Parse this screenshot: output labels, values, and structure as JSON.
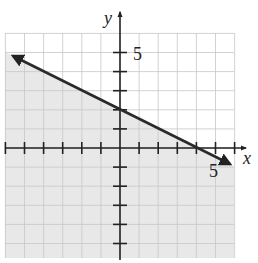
{
  "cropped_heading_fragment": "",
  "graph": {
    "type": "linear-inequality",
    "description": "Shaded half-plane below a decreasing line",
    "boundary_line": {
      "equation": "y = -x/2 + 2",
      "slope": -0.5,
      "y_intercept": 2,
      "x_intercept": 4,
      "style": "solid",
      "color": "#2a2a2a"
    },
    "inequality": "y <= -x/2 + 2",
    "shaded_region": "below",
    "shade_color": "#e6e6e6",
    "grid_color": "#c8c8c8",
    "axis_color": "#222222",
    "axes": {
      "x_label": "x",
      "y_label": "y",
      "x_tick_label": "5",
      "y_tick_label": "5",
      "x_range": [
        -6,
        6
      ],
      "y_range": [
        -5.7,
        6
      ]
    }
  },
  "chart_data": {
    "type": "line",
    "title": "",
    "xlabel": "x",
    "ylabel": "y",
    "xlim": [
      -6,
      6
    ],
    "ylim": [
      -5.7,
      6
    ],
    "grid": true,
    "series": [
      {
        "name": "y = -x/2 + 2",
        "x": [
          -6,
          0,
          4,
          6
        ],
        "y": [
          5,
          2,
          0,
          -1
        ]
      }
    ],
    "shading": "below line",
    "annotations": [
      {
        "text": "5",
        "at": "x=5"
      },
      {
        "text": "5",
        "at": "y=5"
      }
    ]
  }
}
